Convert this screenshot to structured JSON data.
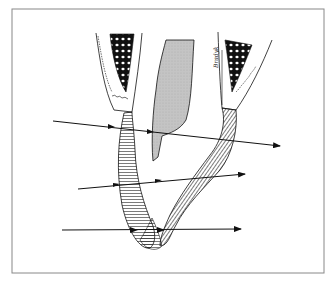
{
  "figure": {
    "frame": {
      "x": 12,
      "y": 9,
      "width": 312,
      "height": 264,
      "stroke": "#888888"
    },
    "colors": {
      "line": "#111111",
      "tooth_fill": "#bdbdbd",
      "bone_fill": "#1a1a1a",
      "background": "#ffffff"
    },
    "signature": "Bradyk",
    "arrows": [
      {
        "name": "upper-arrow",
        "x1": 53,
        "y1": 121,
        "x2": 280,
        "y2": 146
      },
      {
        "name": "middle-arrow",
        "x1": 78,
        "y1": 189,
        "x2": 245,
        "y2": 174
      },
      {
        "name": "lower-arrow",
        "x1": 62,
        "y1": 230,
        "x2": 241,
        "y2": 229
      }
    ]
  }
}
